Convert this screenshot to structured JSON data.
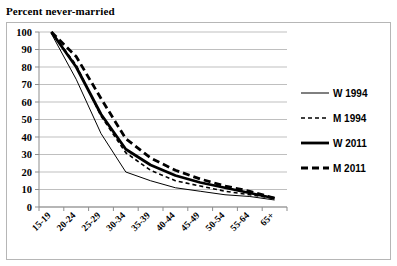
{
  "chart_data": {
    "type": "line",
    "title": "Percent never-married",
    "xlabel": "",
    "ylabel": "",
    "ylim": [
      0,
      100
    ],
    "ytick_step": 10,
    "yticks": [
      100,
      90,
      80,
      70,
      60,
      50,
      40,
      30,
      20,
      10,
      0
    ],
    "grid": true,
    "legend_position": "right",
    "categories": [
      "15-19",
      "20-24",
      "25-29",
      "30-34",
      "35-39",
      "40-44",
      "45-49",
      "50-54",
      "55-64",
      "65+"
    ],
    "series": [
      {
        "name": "W 1994",
        "style": "thin-solid",
        "stroke_width": 1,
        "dash": "none",
        "values": [
          99,
          73,
          42,
          20,
          15,
          11,
          9,
          7,
          6,
          4
        ]
      },
      {
        "name": "M 1994",
        "style": "thin-dashed",
        "stroke_width": 1.6,
        "dash": "4,3",
        "values": [
          100,
          81,
          52,
          31,
          21,
          15,
          12,
          9,
          7,
          5
        ]
      },
      {
        "name": "W 2011",
        "style": "thick-solid",
        "stroke_width": 2.8,
        "dash": "none",
        "values": [
          100,
          80,
          53,
          33,
          24,
          18,
          14,
          11,
          8,
          5
        ]
      },
      {
        "name": "M 2011",
        "style": "thick-dashed",
        "stroke_width": 2.8,
        "dash": "7,4",
        "values": [
          100,
          86,
          62,
          39,
          28,
          21,
          16,
          12,
          9,
          5
        ]
      }
    ]
  },
  "legend": {
    "items": [
      {
        "label": "W 1994"
      },
      {
        "label": "M 1994"
      },
      {
        "label": "W 2011"
      },
      {
        "label": "M 2011"
      }
    ]
  }
}
